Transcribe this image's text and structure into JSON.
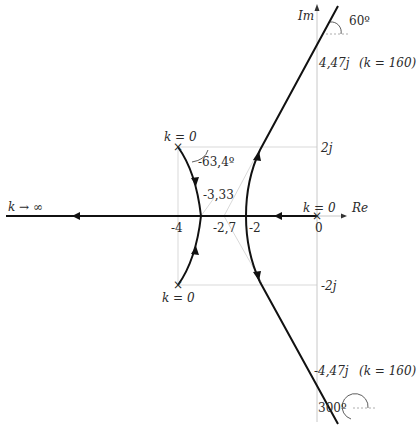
{
  "diagram": {
    "type": "root-locus",
    "axes": {
      "real_label": "Re",
      "imag_label": "Im",
      "origin_label": "0"
    },
    "real_ticks": [
      "-4",
      "-2,7",
      "-2"
    ],
    "imag_ticks": {
      "pos2": "2j",
      "neg2": "-2j",
      "pos447": "4,47j",
      "neg447": "-4,47j"
    },
    "annotations": {
      "k_inf": "k → ∞",
      "k0_top": "k = 0",
      "k0_bottom": "k = 0",
      "k0_origin": "k = 0",
      "departure_angle": "-63,4º",
      "breakaway": "-3,33",
      "k160_top": "(k = 160)",
      "k160_bottom": "(k = 160)",
      "angle_top": "60º",
      "angle_bottom": "300º"
    },
    "poles": [
      {
        "re": 0,
        "im": 0
      },
      {
        "re": -4,
        "im": 2
      },
      {
        "re": -4,
        "im": -2
      }
    ],
    "breakaway_point": -3.33,
    "asymptote_centroid": -2.7,
    "imag_axis_crossing": {
      "im": 4.47,
      "k": 160
    },
    "asymptote_angles_deg": [
      60,
      180,
      300
    ]
  }
}
